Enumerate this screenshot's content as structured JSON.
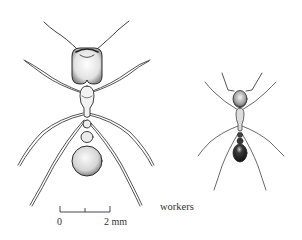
{
  "figure": {
    "caption": "workers",
    "subjects": [
      {
        "name": "major-worker",
        "description": "large ant, dorsal view, big head and round gaster"
      },
      {
        "name": "minor-worker",
        "description": "small ant, dorsal view, dark gaster"
      }
    ],
    "scale_bar": {
      "start_label": "0",
      "end_label": "2 mm",
      "ticks": 3
    },
    "colors": {
      "ink": "#2a2a2a",
      "shade": "#9a9a9a",
      "dark_gaster": "#1e1e1e",
      "background": "#ffffff"
    }
  }
}
